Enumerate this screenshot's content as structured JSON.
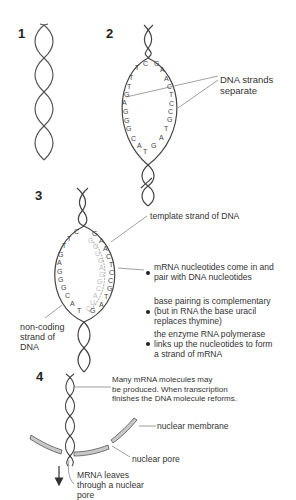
{
  "steps": [
    {
      "number": "1"
    },
    {
      "number": "2",
      "label": [
        "DNA strands",
        "separate"
      ],
      "left_bases": [
        "T",
        "T",
        "G",
        "A",
        "G",
        "G",
        "G",
        "C",
        "A",
        "T"
      ],
      "right_bases": [
        "G",
        "A",
        "A",
        "C",
        "T",
        "C",
        "C",
        "G",
        "T",
        "A",
        "G"
      ]
    },
    {
      "number": "3",
      "template_label": "template strand of DNA",
      "noncoding_label": [
        "non-coding",
        "strand of",
        "DNA"
      ],
      "bullets": [
        [
          "mRNA nucleotides come in and",
          "pair with DNA nucleotides"
        ],
        [
          "base pairing is complementary",
          "(but in RNA the base uracil",
          "replaces thymine)"
        ],
        [
          "the enzyme RNA polymerase",
          "links up the nucleotides to form",
          "a strand of mRNA"
        ]
      ],
      "left_bases": [
        "C",
        "T",
        "T",
        "G",
        "A",
        "G",
        "G",
        "G",
        "C",
        "A",
        "T"
      ],
      "right_bases": [
        "G",
        "A",
        "A",
        "C",
        "T",
        "C",
        "C",
        "G",
        "T",
        "A",
        "G"
      ],
      "mrna_bases": [
        "C",
        "U",
        "U",
        "G",
        "A",
        "G",
        "G",
        "C",
        "A",
        "U",
        "C"
      ]
    },
    {
      "number": "4",
      "reform_label": [
        "Many mRNA molecules may",
        "be produced.  When transcription",
        "finishes the DNA molecule reforms."
      ],
      "membrane_label": "nuclear membrane",
      "pore_label": "nuclear pore",
      "leave_label": [
        "MRNA leaves",
        "through a nuclear",
        "pore"
      ]
    }
  ],
  "colors": {
    "strand": "#444444",
    "mrna": "#bbbbbb",
    "membrane": "#c8c8c8",
    "text": "#333333"
  }
}
